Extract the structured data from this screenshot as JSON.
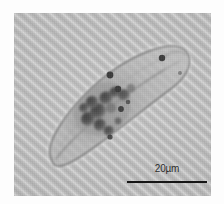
{
  "figure": {
    "kind": "light-micrograph",
    "plate_background_color": "#b9b9b9",
    "margin_color": "#fdfdfd",
    "plate": {
      "x": 14,
      "y": 13,
      "width": 197,
      "height": 183
    },
    "background_texture": "diagonal stripes running lower-left to upper-right"
  },
  "scalebar": {
    "label": "20µm",
    "value": 20,
    "unit": "µm",
    "bar_color": "#161616",
    "label_color": "#2a2a2a",
    "bar_length_px": 80,
    "position": "bottom-right"
  },
  "specimen": {
    "outline_color": "#6d6d6d",
    "body_fill_color": "#b0b0b0",
    "granule_color": "#4a4a4a",
    "anterior": "rounded bulb at upper right",
    "posterior": "tapered rounded tip at lower left",
    "dorsal_dots": 2,
    "granule_cluster": "dark endoplasmic granules / food vacuoles in mid-body"
  }
}
